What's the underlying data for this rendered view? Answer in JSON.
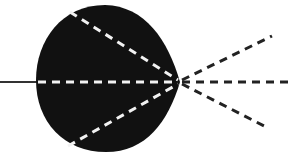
{
  "diagram": {
    "colors": {
      "background": "#ffffff",
      "body": "#111111",
      "inner_dash": "#f2f2f2",
      "outer_dash": "#222222",
      "input_line": "#333333"
    },
    "input_line": {
      "x1": 0,
      "y1": 82,
      "x2": 38,
      "y2": 82
    },
    "apex": {
      "x": 180,
      "y": 82
    },
    "inner_rays": [
      {
        "name": "upper",
        "x1": 70,
        "y1": 12,
        "x2": 178,
        "y2": 80
      },
      {
        "name": "middle",
        "x1": 38,
        "y1": 82,
        "x2": 178,
        "y2": 82
      },
      {
        "name": "lower",
        "x1": 68,
        "y1": 146,
        "x2": 178,
        "y2": 84
      }
    ],
    "outer_rays": [
      {
        "name": "upper",
        "x1": 182,
        "y1": 80,
        "x2": 272,
        "y2": 36
      },
      {
        "name": "middle",
        "x1": 182,
        "y1": 82,
        "x2": 294,
        "y2": 82
      },
      {
        "name": "lower",
        "x1": 182,
        "y1": 84,
        "x2": 268,
        "y2": 128
      }
    ]
  }
}
